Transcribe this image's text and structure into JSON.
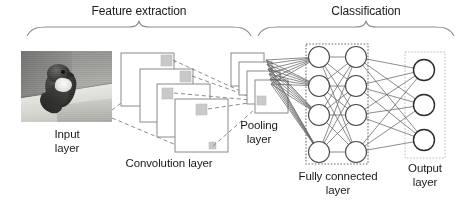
{
  "brackets": {
    "feature_extraction": "Feature extraction",
    "classification": "Classification"
  },
  "labels": {
    "input_layer": "Input\nlayer",
    "convolution_layer": "Convolution layer",
    "pooling_layer": "Pooling\nlayer",
    "fully_connected_layer": "Fully connected\nlayer",
    "output_layer": "Output\nlayer"
  },
  "colors": {
    "text": "#1a1a1a",
    "stroke": "#6e6e6e",
    "stroke_dark": "#3c3c3c",
    "kernel_fill": "#c9c9c9",
    "dotted_box": "#6e6e6e",
    "output_box": "#b8b8b8",
    "background": "#ffffff"
  },
  "architecture": {
    "input": {
      "type": "image",
      "description": "grayscale photograph of a bird perched on a ledge"
    },
    "convolution": {
      "type": "feature-map-stack",
      "count": 4,
      "kernel_patches": 4
    },
    "pooling": {
      "type": "feature-map-stack",
      "count": 4,
      "kernel_patches": 1
    },
    "fully_connected": {
      "type": "dense",
      "layers": 2,
      "nodes_per_layer": [
        4,
        4
      ]
    },
    "output": {
      "type": "dense",
      "nodes": 3
    }
  }
}
